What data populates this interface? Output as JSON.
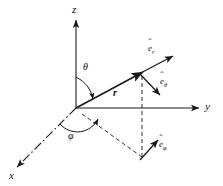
{
  "figure": {
    "background_color": "#ffffff",
    "line_color": "#1a1a1a",
    "width": 223,
    "height": 186
  },
  "axes": [
    {
      "name": "z-axis",
      "label": "z",
      "direction": "up",
      "style": "solid-arrow"
    },
    {
      "name": "y-axis",
      "label": "y",
      "direction": "right",
      "style": "solid-arrow"
    },
    {
      "name": "x-axis",
      "label": "x",
      "direction": "lower-left",
      "style": "dash-dot-arrow"
    }
  ],
  "angles": [
    {
      "name": "theta",
      "label": "θ",
      "description": "polar angle from z-axis to r"
    },
    {
      "name": "phi",
      "label": "φ",
      "description": "azimuthal angle from x-axis to projection"
    }
  ],
  "vectors": [
    {
      "name": "position-vector",
      "label": "r",
      "description": "radial position vector from origin"
    },
    {
      "name": "e-r",
      "label": "e",
      "subscript": "r",
      "hat": "ˆ",
      "description": "radial unit vector"
    },
    {
      "name": "e-theta",
      "label": "e",
      "subscript": "θ",
      "hat": "ˆ",
      "description": "polar unit vector"
    },
    {
      "name": "e-phi",
      "label": "e",
      "subscript": "φ",
      "hat": "ˆ",
      "description": "azimuthal unit vector"
    }
  ],
  "construction_lines": [
    {
      "name": "vertical-drop",
      "style": "dashed",
      "description": "dashed vertical from point to xy-plane"
    },
    {
      "name": "projection-line",
      "style": "dashed",
      "description": "dashed line from origin to xy-plane projection"
    },
    {
      "name": "projection-to-y",
      "style": "dashed",
      "description": "dashed line from projection toward y-axis"
    }
  ]
}
